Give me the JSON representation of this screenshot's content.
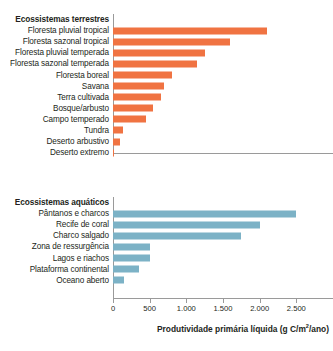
{
  "chart_data": [
    {
      "type": "bar",
      "orientation": "horizontal",
      "title": "Ecossistemas terrestres",
      "xlabel": "",
      "ylabel": "",
      "xlim": [
        0,
        3000
      ],
      "grid": false,
      "legend": "none",
      "color": "#f07342",
      "tick_labels_visible": false,
      "categories": [
        "Floresta pluvial tropical",
        "Floresta sazonal tropical",
        "Floresta pluvial temperada",
        "Floresta sazonal temperada",
        "Floresta boreal",
        "Savana",
        "Terra cultivada",
        "Bosque/arbusto",
        "Campo temperado",
        "Tundra",
        "Deserto arbustivo",
        "Deserto extremo"
      ],
      "values": [
        2100,
        1600,
        1250,
        1150,
        800,
        700,
        650,
        550,
        450,
        140,
        90,
        20
      ]
    },
    {
      "type": "bar",
      "orientation": "horizontal",
      "title": "Ecossistemas aquáticos",
      "xlabel": "Produtividade primária líquida (g C/m²/ano)",
      "ylabel": "",
      "xlim": [
        0,
        3000
      ],
      "grid": false,
      "legend": "none",
      "color": "#7cb2c6",
      "tick_labels_visible": true,
      "tick_values": [
        0,
        500,
        1000,
        1500,
        2000,
        2500
      ],
      "tick_labels": [
        "0",
        "500",
        "1.000",
        "1.500",
        "2.000",
        "2.500"
      ],
      "categories": [
        "Pântanos e charcos",
        "Recife de coral",
        "Charco salgado",
        "Zona de ressurgência",
        "Lagos e riachos",
        "Plataforma continental",
        "Oceano aberto"
      ],
      "values": [
        2500,
        2000,
        1750,
        500,
        500,
        360,
        150
      ]
    }
  ],
  "axis_title": {
    "prefix": "Produtividade primária líquida (g C/m",
    "superscript": "2",
    "suffix": "/ano)"
  },
  "colors": {
    "terrestrial_bar": "#f07342",
    "aquatic_bar": "#7cb2c6",
    "axis_line": "#9a9a9a",
    "text": "#231f20"
  }
}
